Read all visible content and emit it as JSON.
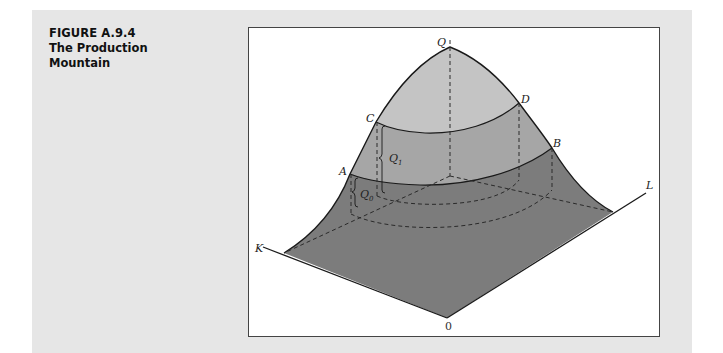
{
  "caption": {
    "figure_number": "FIGURE A.9.4",
    "title_line1": "The Production",
    "title_line2": "Mountain"
  },
  "diagram": {
    "colors": {
      "panel_bg": "#e6e6e6",
      "frame_bg": "#ffffff",
      "top_cap": "#c4c4c4",
      "middle_band": "#a6a6a6",
      "base_surface": "#7c7c7c",
      "outline": "#1a1a1a",
      "dashed": "#2a2a2a"
    },
    "labels": {
      "peak": "Q",
      "C": "C",
      "D": "D",
      "A": "A",
      "B": "B",
      "Q1": "Q",
      "Q1_sub": "1",
      "Q0": "Q",
      "Q0_sub": "0",
      "K_axis": "K",
      "L_axis": "L",
      "origin": "0"
    },
    "points": {
      "peak": [
        450,
        47
      ],
      "C": [
        376,
        122
      ],
      "D": [
        519,
        103
      ],
      "A": [
        350,
        174
      ],
      "B": [
        552,
        148
      ],
      "center": [
        450,
        176
      ],
      "origin": [
        447,
        318
      ],
      "K_corner": [
        284,
        253
      ],
      "L_corner": [
        613,
        212
      ],
      "K_axis_end": [
        263,
        247
      ],
      "L_axis_end": [
        646,
        193
      ]
    }
  }
}
